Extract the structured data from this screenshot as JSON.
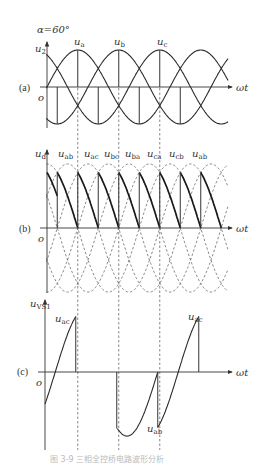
{
  "figure": {
    "alpha_label": "α=60°",
    "x_axis_label": "ωt",
    "origin_label": "o",
    "caption": "图 3-9  三相全控桥电路波形分析"
  },
  "panels": [
    {
      "id": "a",
      "tag": "(a)",
      "y_label": "u",
      "y_label_sub": "2",
      "curve_labels": [
        {
          "text": "u",
          "sub": "a"
        },
        {
          "text": "u",
          "sub": "b"
        },
        {
          "text": "u",
          "sub": "c"
        }
      ]
    },
    {
      "id": "b",
      "tag": "(b)",
      "y_label": "u",
      "y_label_sub": "d",
      "segment_labels": [
        {
          "text": "u",
          "sub": "ab"
        },
        {
          "text": "u",
          "sub": "ac"
        },
        {
          "text": "u",
          "sub": "bc"
        },
        {
          "text": "u",
          "sub": "ba"
        },
        {
          "text": "u",
          "sub": "ca"
        },
        {
          "text": "u",
          "sub": "cb"
        },
        {
          "text": "u",
          "sub": "ab"
        }
      ]
    },
    {
      "id": "c",
      "tag": "(c)",
      "y_label": "u",
      "y_label_sub": "VS1",
      "curve_labels": [
        {
          "text": "u",
          "sub": "ac"
        },
        {
          "text": "u",
          "sub": "ab"
        },
        {
          "text": "u",
          "sub": "ac"
        }
      ]
    }
  ],
  "chart_data": {
    "type": "line",
    "xlabel": "ωt",
    "x_unit": "degrees",
    "x_range": [
      0,
      540
    ],
    "panels": [
      {
        "id": "a",
        "ylabel": "u2",
        "series": [
          {
            "name": "ua",
            "formula": "sin(θ)",
            "peak_deg": 90
          },
          {
            "name": "ub",
            "formula": "sin(θ-120°)",
            "peak_deg": 210
          },
          {
            "name": "uc",
            "formula": "sin(θ-240°)",
            "peak_deg": 330
          }
        ],
        "firing_lines_positive_deg": [
          90,
          210,
          330
        ],
        "firing_lines_negative_deg": [
          30,
          150,
          270,
          390
        ]
      },
      {
        "id": "b",
        "ylabel": "ud",
        "segments": [
          "uab",
          "uac",
          "ubc",
          "uba",
          "uca",
          "ucb",
          "uab"
        ],
        "firing_deg": [
          30,
          90,
          150,
          210,
          270,
          330,
          390,
          450
        ],
        "segment_span_deg": 60,
        "note": "ud segments fall from 1.5 to 0 (per unit of phase peak) each 60°"
      },
      {
        "id": "c",
        "ylabel": "uVS1",
        "pieces": [
          {
            "name": "uac",
            "from_deg": 0,
            "to_deg": 90
          },
          {
            "name": "0",
            "from_deg": 90,
            "to_deg": 210
          },
          {
            "name": "uab",
            "from_deg": 210,
            "to_deg": 330
          },
          {
            "name": "uac",
            "from_deg": 330,
            "to_deg": 450
          }
        ]
      }
    ],
    "dashed_guides_deg": [
      90,
      210,
      330
    ]
  }
}
